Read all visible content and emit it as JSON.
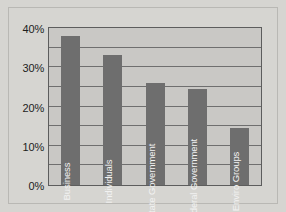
{
  "chart_data": {
    "type": "bar",
    "title": "",
    "subtitle": "",
    "xlabel": "",
    "ylabel": "",
    "categories": [
      "Business",
      "Individuals",
      "State Government",
      "Federal Government",
      "Enviro Groups"
    ],
    "values": [
      38,
      33,
      26,
      24.5,
      14.5
    ],
    "value_labels": [
      "38%",
      "33%",
      "26%",
      "24.5%",
      "14.5%"
    ],
    "ylim": [
      0,
      40
    ],
    "ytick_labels": [
      "0%",
      "10%",
      "20%",
      "30%",
      "40%"
    ],
    "ytick_values": [
      0,
      10,
      20,
      30,
      40
    ],
    "gridline_values": [
      5,
      10,
      15,
      20,
      25,
      30,
      35,
      40
    ],
    "grid": true,
    "grid_interval": 5,
    "legend": "none",
    "orientation": "vertical",
    "bar_label_rotation": -90,
    "colors": {
      "bar_fill": "#6e6e6e",
      "plot_background": "#c9c8c5",
      "figure_background": "#d6d5d1",
      "gridline": "#6f6f6f",
      "axis_line": "#5d5d5d",
      "tick_text": "#1d1d1d",
      "bar_label_text": "#f2f2f2"
    }
  }
}
